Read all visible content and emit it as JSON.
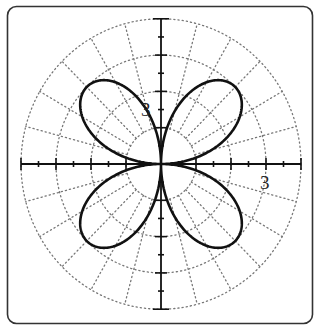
{
  "chart_data": {
    "type": "line",
    "subtype": "polar",
    "title": "",
    "equation": "r = 3 sin(2θ)",
    "amplitude": 3,
    "petals": 4,
    "theta_range": [
      0,
      6.283185
    ],
    "axes": {
      "x_range": [
        -4,
        4
      ],
      "y_range": [
        -4,
        4
      ],
      "tick_step": 0.5,
      "major_tick_step": 1,
      "labels": [
        {
          "text": "3",
          "axis": "x",
          "value": 3
        },
        {
          "text": "3",
          "axis": "y",
          "value": 3
        }
      ]
    },
    "grid": {
      "circles": [
        1,
        2,
        3,
        4
      ],
      "radial_step_deg": 15,
      "style": "dotted"
    },
    "colors": {
      "curve": "#111111",
      "axes": "#111111",
      "grid": "#777777",
      "frame": "#333333"
    }
  },
  "labels": {
    "x_axis_label": "3",
    "y_axis_label": "3"
  }
}
